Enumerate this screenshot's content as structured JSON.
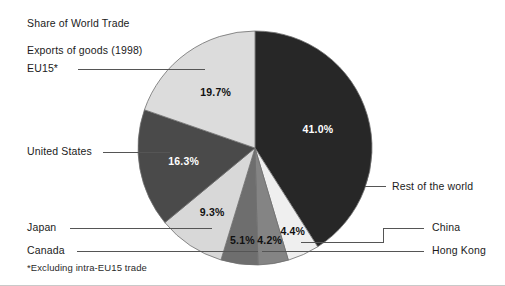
{
  "figure": {
    "title_line1": "Share of World Trade",
    "title_line2": "Exports of goods (1998)",
    "footnote": "*Excluding intra-EU15 trade"
  },
  "chart_data": {
    "type": "pie",
    "title": "Share of World Trade Exports of goods (1998)",
    "subtitle": "Exports of goods (1998)",
    "xlabel": "",
    "ylabel": "",
    "units": "percent",
    "start_angle_deg": 0,
    "direction": "clockwise",
    "legend_position": "callout-labels",
    "grid": false,
    "footnote": "*Excluding intra-EU15 trade",
    "categories": [
      "Rest of the world",
      "China",
      "Hong Kong",
      "Canada",
      "Japan",
      "United States",
      "EU15*"
    ],
    "values": [
      41.0,
      4.4,
      4.2,
      5.1,
      9.3,
      16.3,
      19.7
    ],
    "value_labels": [
      "41.0%",
      "4.4%",
      "4.2%",
      "5.1%",
      "9.3%",
      "16.3%",
      "19.7%"
    ],
    "colors": [
      "#272727",
      "#efefef",
      "#848484",
      "#6e6e6e",
      "#d8d8d8",
      "#4a4a4a",
      "#dcdcdc"
    ],
    "slices": [
      {
        "name": "Rest of the world",
        "value": 41.0,
        "label": "41.0%",
        "color": "#272727",
        "label_color": "#ffffff",
        "callout_side": "right"
      },
      {
        "name": "China",
        "value": 4.4,
        "label": "4.4%",
        "color": "#efefef",
        "label_color": "#111111",
        "callout_side": "right"
      },
      {
        "name": "Hong Kong",
        "value": 4.2,
        "label": "4.2%",
        "color": "#848484",
        "label_color": "#111111",
        "callout_side": "right"
      },
      {
        "name": "Canada",
        "value": 5.1,
        "label": "5.1%",
        "color": "#6e6e6e",
        "label_color": "#111111",
        "callout_side": "left"
      },
      {
        "name": "Japan",
        "value": 9.3,
        "label": "9.3%",
        "color": "#d8d8d8",
        "label_color": "#111111",
        "callout_side": "left"
      },
      {
        "name": "United States",
        "value": 16.3,
        "label": "16.3%",
        "color": "#4a4a4a",
        "label_color": "#ffffff",
        "callout_side": "left"
      },
      {
        "name": "EU15*",
        "value": 19.7,
        "label": "19.7%",
        "color": "#dcdcdc",
        "label_color": "#111111",
        "callout_side": "left"
      }
    ]
  },
  "callouts": {
    "rest_of_world": "Rest of the world",
    "china": "China",
    "hong_kong": "Hong Kong",
    "canada": "Canada",
    "japan": "Japan",
    "united_states": "United States",
    "eu15": "EU15*"
  },
  "slice_values": {
    "rest_of_world": "41.0%",
    "china": "4.4%",
    "hong_kong": "4.2%",
    "canada": "5.1%",
    "japan": "9.3%",
    "united_states": "16.3%",
    "eu15": "19.7%"
  }
}
